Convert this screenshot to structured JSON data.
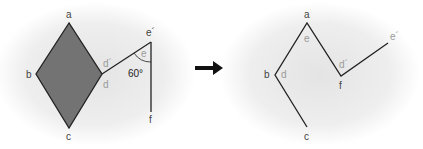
{
  "colors": {
    "fill": "#737373",
    "stroke": "#222222",
    "label": "#444444",
    "label_light": "#9a9a9a",
    "halo": "#e9e9e9"
  },
  "left": {
    "labels": {
      "a": "a",
      "b": "b",
      "c": "c",
      "d_prime": "d´",
      "d": "d",
      "e_prime": "e´",
      "e": "e",
      "f": "f",
      "angle": "60°"
    }
  },
  "right": {
    "labels": {
      "a": "a",
      "e": "e",
      "b": "b",
      "d": "d",
      "d_prime": "d´",
      "f": "f",
      "e_prime": "e´",
      "c": "c"
    }
  },
  "arrow": {
    "name": "right-arrow"
  }
}
